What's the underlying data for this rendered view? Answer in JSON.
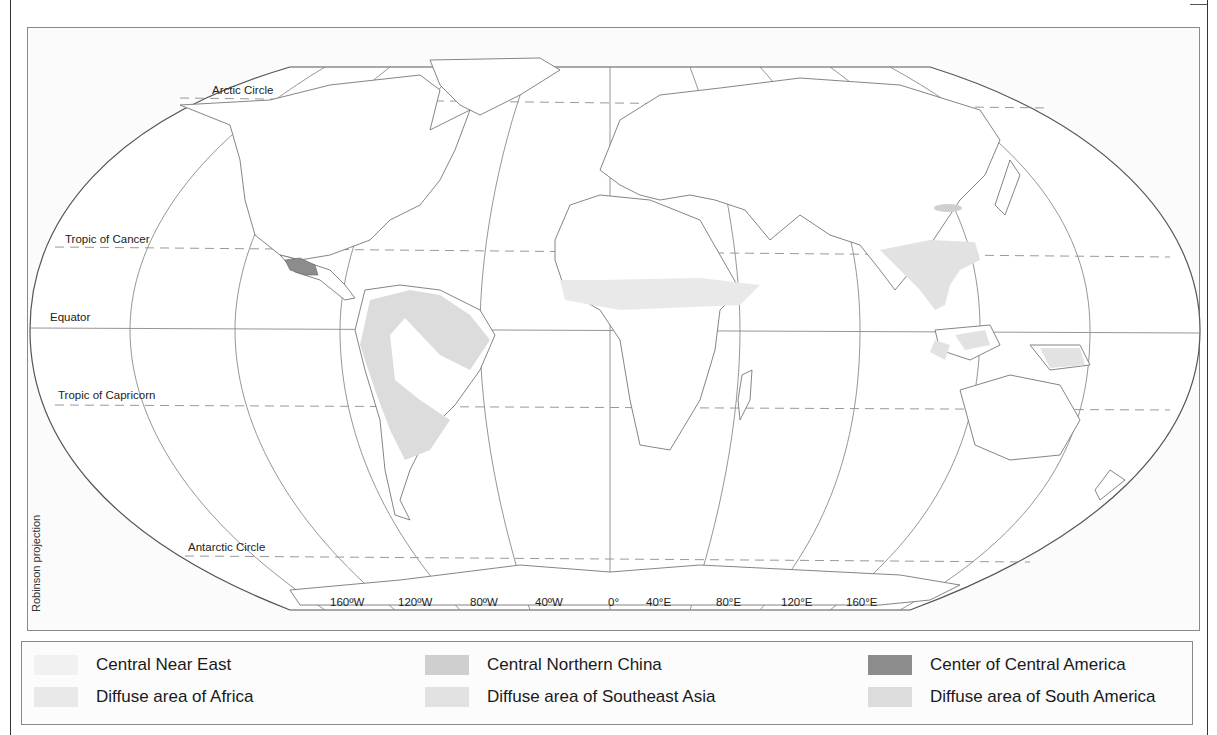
{
  "map": {
    "projection_label": "Robinson projection",
    "latitude_labels": {
      "arctic": "Arctic Circle",
      "cancer": "Tropic of Cancer",
      "equator": "Equator",
      "capricorn": "Tropic of Capricorn",
      "antarctic": "Antarctic Circle"
    },
    "longitude_labels": [
      "160ºW",
      "120ºW",
      "80ºW",
      "40ºW",
      "0°",
      "40°E",
      "80°E",
      "120°E",
      "160°E"
    ],
    "colors": {
      "outline": "#555555",
      "graticule": "#8a8a8a",
      "coast": "#777777",
      "near_east": "#f1f1f1",
      "africa": "#e9e9e9",
      "north_china": "#cfcfcf",
      "southeast_asia": "#e2e2e2",
      "central_america": "#8c8c8c",
      "south_america": "#dcdcdc"
    }
  },
  "legend": {
    "items": [
      {
        "label": "Central Near East",
        "color": "#f1f1f1"
      },
      {
        "label": "Diffuse area of Africa",
        "color": "#e9e9e9"
      },
      {
        "label": "Central Northern China",
        "color": "#cfcfcf"
      },
      {
        "label": "Diffuse area of Southeast Asia",
        "color": "#e2e2e2"
      },
      {
        "label": "Center of Central America",
        "color": "#8c8c8c"
      },
      {
        "label": "Diffuse area of South America",
        "color": "#dcdcdc"
      }
    ]
  }
}
